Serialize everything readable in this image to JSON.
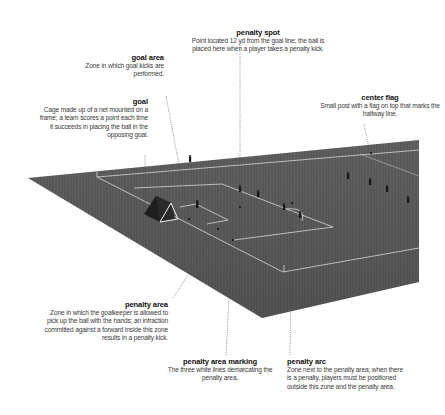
{
  "colors": {
    "background": "#ffffff",
    "pitch": "#5e5e5e",
    "pitch_stripe": "#666666",
    "lines": "#d8d8d8",
    "leader": "#444444",
    "title_text": "#111111",
    "body_text": "#3a3a3a"
  },
  "callouts": {
    "penalty_spot": {
      "title": "penalty spot",
      "desc_1": "Point located 12 yd from the goal line; the ball is",
      "desc_2": "placed here when a player takes a penalty kick."
    },
    "goal_area": {
      "title": "goal area",
      "desc_1": "Zone in which goal kicks are",
      "desc_2": "performed."
    },
    "goal": {
      "title": "goal",
      "desc_1": "Cage made up of a net mounted on a",
      "desc_2": "frame; a team scores a point each time",
      "desc_3": "it succeeds in placing the ball in the",
      "desc_4": "opposing goal."
    },
    "center_flag": {
      "title": "center flag",
      "desc_1": "Small post with a flag on top that marks the",
      "desc_2": "halfway line."
    },
    "penalty_area": {
      "title": "penalty area",
      "desc_1": "Zone in which the goalkeeper is allowed to",
      "desc_2": "pick up the ball with the hands; an infraction",
      "desc_3": "committed against a forward inside this zone",
      "desc_4": "results in a penalty kick."
    },
    "penalty_area_marking": {
      "title": "penalty area marking",
      "desc_1": "The three white lines demarcating the",
      "desc_2": "penalty area."
    },
    "penalty_arc": {
      "title": "penalty arc",
      "desc_1": "Zone next to the penalty area; when there",
      "desc_2": "is a penalty, players must be positioned",
      "desc_3": "outside this zone and the penalty area."
    }
  }
}
